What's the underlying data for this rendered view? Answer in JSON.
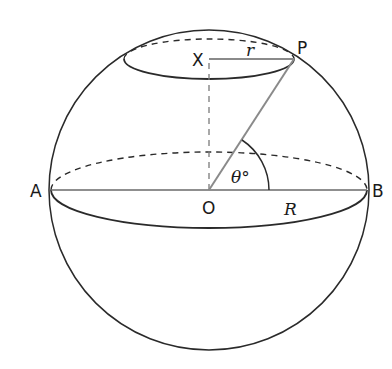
{
  "diagram": {
    "labels": {
      "A": "A",
      "B": "B",
      "O": "O",
      "X": "X",
      "P": "P",
      "small_radius": "r",
      "big_radius": "R",
      "angle": "θ°"
    },
    "colors": {
      "outline": "#2a2a2a",
      "radius_line": "#8a8a8a",
      "dashed": "#2a2a2a",
      "background": "#ffffff"
    }
  }
}
